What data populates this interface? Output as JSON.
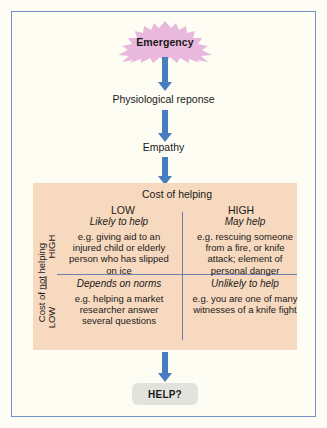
{
  "diagram": {
    "frame_border_color": "#7392c4",
    "frame_background": "#fefdf3",
    "arrow_color": "#4a7cc0",
    "starburst_color": "#e9b8dd",
    "matrix_background": "#f7d9bf",
    "divider_color": "#6c7fae",
    "help_box_color": "#e3e3dd"
  },
  "flow": {
    "emergency": "Emergency",
    "physiological": "Physiological reponse",
    "empathy": "Empathy",
    "outcome": "HELP?"
  },
  "matrix": {
    "column_axis_title": "Cost of helping",
    "column_headers": [
      "LOW",
      "HIGH"
    ],
    "row_axis_title_prefix": "Cost of ",
    "row_axis_title_underlined": "not",
    "row_axis_title_suffix": " helping",
    "row_headers": [
      "HIGH",
      "LOW"
    ],
    "cells": [
      {
        "id": "high-cost-not-helping-low-cost-helping",
        "heading": "Likely to help",
        "body": "e.g. giving aid to an injured child or elderly person who has slipped on ice"
      },
      {
        "id": "high-cost-not-helping-high-cost-helping",
        "heading": "May help",
        "body": "e.g. rescuing someone from a fire, or knife attack; element of personal danger"
      },
      {
        "id": "low-cost-not-helping-low-cost-helping",
        "heading": "Depends on norms",
        "body": "e.g. helping a market researcher answer several questions"
      },
      {
        "id": "low-cost-not-helping-high-cost-helping",
        "heading": "Unlikely to help",
        "body": "e.g. you are one of many witnesses of a knife fight"
      }
    ]
  }
}
